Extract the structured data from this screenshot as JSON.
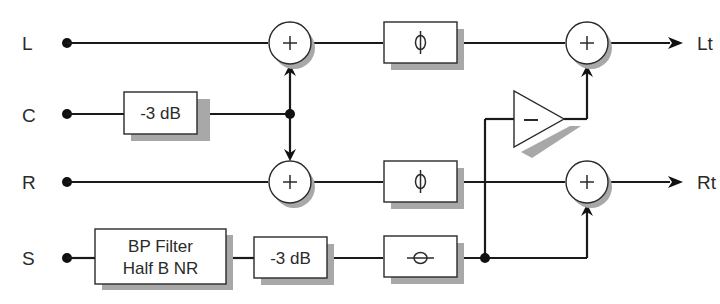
{
  "diagram": {
    "inputs": [
      {
        "id": "L",
        "label": "L"
      },
      {
        "id": "C",
        "label": "C"
      },
      {
        "id": "R",
        "label": "R"
      },
      {
        "id": "S",
        "label": "S"
      }
    ],
    "outputs": [
      {
        "id": "Lt",
        "label": "Lt"
      },
      {
        "id": "Rt",
        "label": "Rt"
      }
    ],
    "blocks": {
      "c_atten": {
        "label": "-3 dB"
      },
      "s_filter": {
        "line1": "BP Filter",
        "line2": "Half B NR"
      },
      "s_atten": {
        "label": "-3 dB"
      },
      "l_phase": {
        "symbol": "ϕ"
      },
      "r_phase": {
        "symbol": "ϕ"
      },
      "s_phase": {
        "symbol": "θ (90° phase shift)"
      },
      "inverter": {
        "symbol": "−"
      }
    },
    "summers": [
      {
        "id": "sum_L",
        "symbol": "+"
      },
      {
        "id": "sum_R",
        "symbol": "+"
      },
      {
        "id": "sum_Lt",
        "symbol": "+"
      },
      {
        "id": "sum_Rt",
        "symbol": "+"
      }
    ],
    "colors": {
      "line": "#1a1a1a",
      "box_fill": "#ffffff",
      "shadow": "#a8a8a8",
      "text": "#2a2a2a"
    }
  }
}
